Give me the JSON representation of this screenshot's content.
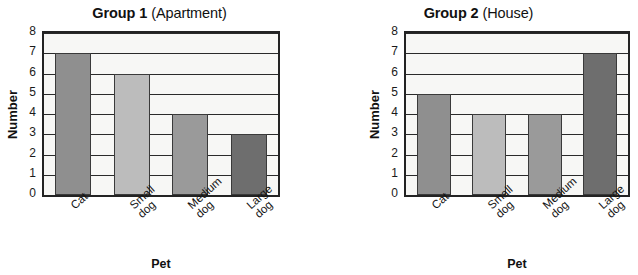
{
  "chart_data": [
    {
      "type": "bar",
      "title": "Group 1 (Apartment)",
      "title_strong": "Group 1",
      "title_light": "(Apartment)",
      "categories": [
        "Cat",
        "Small dog",
        "Medium dog",
        "Large dog"
      ],
      "category_lines": [
        [
          "Cat",
          ""
        ],
        [
          "Small",
          "dog"
        ],
        [
          "Medium",
          "dog"
        ],
        [
          "Large",
          "dog"
        ]
      ],
      "values": [
        7,
        6,
        4,
        3
      ],
      "xlabel": "Pet",
      "ylabel": "Number",
      "ylim": [
        0,
        8
      ],
      "yticks": [
        0,
        1,
        2,
        3,
        4,
        5,
        6,
        7,
        8
      ],
      "grid": true,
      "legend": "none",
      "bar_colors": [
        "#8f8f8f",
        "#bcbcbc",
        "#9a9a9a",
        "#6e6e6e"
      ]
    },
    {
      "type": "bar",
      "title": "Group 2 (House)",
      "title_strong": "Group 2",
      "title_light": "(House)",
      "categories": [
        "Cat",
        "Small dog",
        "Medium dog",
        "Large dog"
      ],
      "category_lines": [
        [
          "Cat",
          ""
        ],
        [
          "Small",
          "dog"
        ],
        [
          "Medium",
          "dog"
        ],
        [
          "Large",
          "dog"
        ]
      ],
      "values": [
        5,
        4,
        4,
        7
      ],
      "xlabel": "Pet",
      "ylabel": "Number",
      "ylim": [
        0,
        8
      ],
      "yticks": [
        0,
        1,
        2,
        3,
        4,
        5,
        6,
        7,
        8
      ],
      "grid": true,
      "legend": "none",
      "bar_colors": [
        "#8f8f8f",
        "#bcbcbc",
        "#9a9a9a",
        "#6e6e6e"
      ]
    }
  ],
  "style": {
    "plot_background": "#f7f7f5",
    "axis_color": "#232323",
    "grid_color": "#2a2a2a",
    "text_color": "#111111"
  }
}
